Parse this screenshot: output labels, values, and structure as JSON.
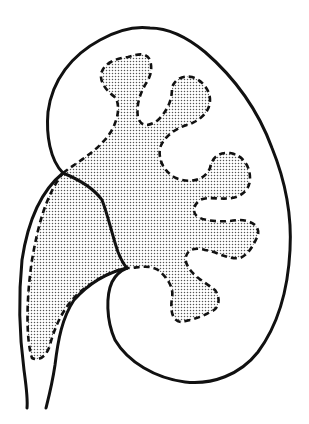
{
  "diagram": {
    "parts": [
      {
        "name": "kidney-outline",
        "style": "solid outline"
      },
      {
        "name": "renal-pelvis-calyces",
        "style": "dashed outline, stippled fill"
      },
      {
        "name": "ureter",
        "style": "solid outline tubes"
      },
      {
        "name": "renal-pelvis-extension",
        "style": "dashed outline, stippled fill"
      }
    ],
    "colors": {
      "stroke": "#111111",
      "dots": "#555555",
      "background": "#ffffff"
    }
  }
}
